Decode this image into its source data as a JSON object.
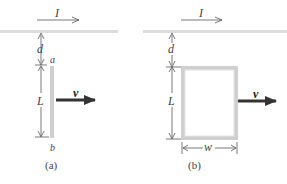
{
  "figure": {
    "panels": [
      {
        "id": "a",
        "caption": "(a)",
        "current_label": "I",
        "gap_label": "d",
        "length_label": "L",
        "end_top_label": "a",
        "end_bottom_label": "b",
        "velocity_label": "v",
        "object": "rod"
      },
      {
        "id": "b",
        "caption": "(b)",
        "current_label": "I",
        "gap_label": "d",
        "length_label": "L",
        "width_label": "w",
        "velocity_label": "v",
        "object": "rectangular loop"
      }
    ],
    "colors": {
      "wire": "#d9d9d9",
      "rod": "#cfcfcf",
      "arrow": "#333333",
      "dimension": "#555555"
    }
  }
}
